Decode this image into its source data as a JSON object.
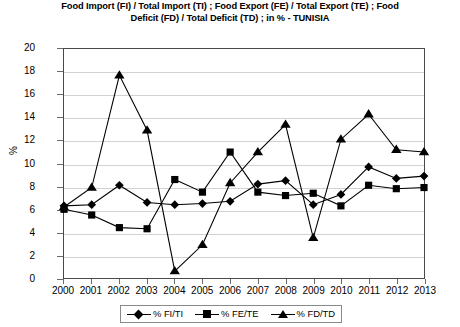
{
  "chart_data": {
    "type": "line",
    "title": "Food Import (FI) / Total Import (TI) ; Food Export (FE) / Total Export (TE) ; Food Deficit (FD) / Total Deficit (TD) ; in % - TUNISIA",
    "xlabel": "",
    "ylabel": "%",
    "ylim": [
      0,
      20
    ],
    "ytick_step": 2,
    "yticks": [
      20,
      18,
      16,
      14,
      12,
      10,
      8,
      6,
      4,
      2,
      0
    ],
    "grid": true,
    "legend_position": "bottom-center",
    "categories": [
      "2000",
      "2001",
      "2002",
      "2003",
      "2004",
      "2005",
      "2006",
      "2007",
      "2008",
      "2009",
      "2010",
      "2011",
      "2012",
      "2013"
    ],
    "x": [
      2000,
      2001,
      2002,
      2003,
      2004,
      2005,
      2006,
      2007,
      2008,
      2009,
      2010,
      2011,
      2012,
      2013
    ],
    "series": [
      {
        "name": "% FI/TI",
        "marker": "diamond",
        "color": "#000000",
        "values": [
          6.3,
          6.4,
          8.1,
          6.6,
          6.4,
          6.5,
          6.7,
          8.2,
          8.5,
          6.4,
          7.3,
          9.7,
          8.7,
          8.9
        ]
      },
      {
        "name": "% FE/TE",
        "marker": "square",
        "color": "#000000",
        "values": [
          6.0,
          5.5,
          4.4,
          4.3,
          8.6,
          7.5,
          11.0,
          7.5,
          7.2,
          7.4,
          6.3,
          8.1,
          7.8,
          7.9
        ]
      },
      {
        "name": "% FD/TD",
        "marker": "triangle",
        "color": "#000000",
        "values": [
          6.2,
          7.9,
          17.7,
          12.9,
          0.6,
          2.9,
          8.3,
          11.0,
          13.4,
          3.5,
          12.1,
          14.3,
          11.2,
          11.0
        ]
      }
    ]
  },
  "legend": {
    "items": [
      {
        "label": "% FI/TI",
        "marker": "diamond"
      },
      {
        "label": "% FE/TE",
        "marker": "square"
      },
      {
        "label": "% FD/TD",
        "marker": "triangle"
      }
    ]
  }
}
